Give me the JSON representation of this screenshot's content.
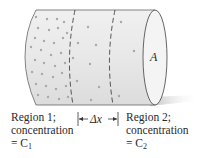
{
  "diagram": {
    "cross_section_label": "A",
    "region1": {
      "line1": "Region 1;",
      "line2": "concentration",
      "line3_prefix": "= C",
      "line3_sub": "1"
    },
    "region2": {
      "line1": "Region 2;",
      "line2": "concentration",
      "line3_prefix": "= C",
      "line3_sub": "2"
    },
    "distance_label": "Δx",
    "colors": {
      "cylinder_fill": "#e6e6e6",
      "outline": "#555555",
      "particles": "#a8a8a8",
      "shadow": "#c8c8c8",
      "text": "#2a2a2a"
    }
  }
}
